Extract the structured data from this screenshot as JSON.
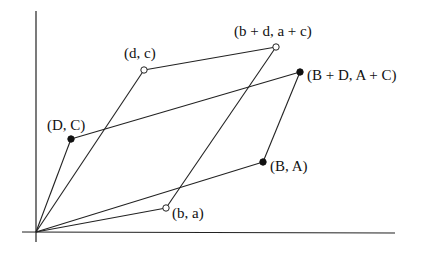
{
  "diagram": {
    "origin": {
      "x": 36,
      "y": 232
    },
    "axes": {
      "x_axis": {
        "x1": 22,
        "y1": 232,
        "x2": 395,
        "y2": 233
      },
      "y_axis": {
        "x1": 36,
        "y1": 11,
        "x2": 36,
        "y2": 242
      }
    },
    "points": {
      "ba": {
        "label": "(b, a)",
        "x": 166,
        "y": 208,
        "style": "open",
        "label_x": 172,
        "label_y": 218
      },
      "dc": {
        "label": "(d, c)",
        "x": 144,
        "y": 70,
        "style": "open",
        "label_x": 124,
        "label_y": 58
      },
      "bdac": {
        "label": "(b + d, a + c)",
        "x": 276,
        "y": 47,
        "style": "open",
        "label_x": 234,
        "label_y": 36
      },
      "BA": {
        "label": "(B, A)",
        "x": 263,
        "y": 162,
        "style": "filled",
        "label_x": 270,
        "label_y": 171
      },
      "DC": {
        "label": "(D, C)",
        "x": 71,
        "y": 139,
        "style": "filled",
        "label_x": 47,
        "label_y": 130
      },
      "BDAC": {
        "label": "(B + D, A + C)",
        "x": 300,
        "y": 72,
        "style": "filled",
        "label_x": 307,
        "label_y": 80
      }
    },
    "colors": {
      "line": "#222222",
      "background": "#ffffff",
      "filled_point": "#111111",
      "open_point_fill": "#ffffff"
    }
  }
}
